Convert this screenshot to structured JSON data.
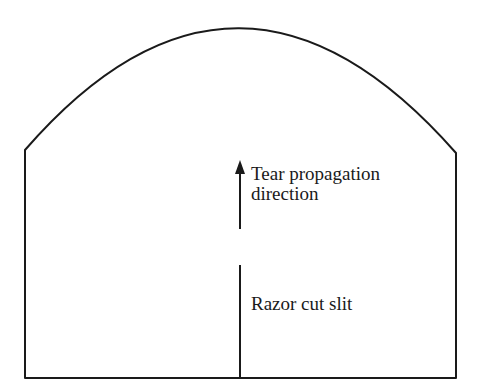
{
  "diagram": {
    "type": "tear-test-specimen",
    "colors": {
      "stroke": "#1a1a1a",
      "background": "#ffffff"
    },
    "labels": {
      "tear_direction_line1": "Tear propagation",
      "tear_direction_line2": "direction",
      "slit": "Razor cut slit"
    }
  }
}
